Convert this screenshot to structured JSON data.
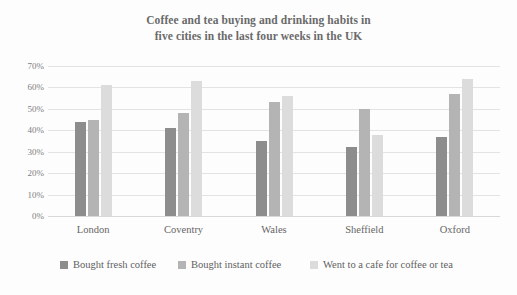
{
  "chart_data": {
    "type": "bar",
    "title": "Coffee and tea buying and drinking habits in five cities in the last four weeks in the UK",
    "title_lines": [
      "Coffee and tea buying and drinking habits in",
      "five cities in the last four weeks in the UK"
    ],
    "xlabel": "",
    "ylabel": "",
    "ylim": [
      0,
      70
    ],
    "ytick_step": 10,
    "yticks": [
      "0%",
      "10%",
      "20%",
      "30%",
      "40%",
      "50%",
      "60%",
      "70%"
    ],
    "ytick_values": [
      0,
      10,
      20,
      30,
      40,
      50,
      60,
      70
    ],
    "grid": true,
    "legend_position": "bottom",
    "categories": [
      "London",
      "Coventry",
      "Wales",
      "Sheffield",
      "Oxford"
    ],
    "series": [
      {
        "name": "Bought fresh coffee",
        "color": "#8d8d8d",
        "values": [
          44,
          41,
          35,
          32,
          37
        ]
      },
      {
        "name": "Bought instant coffee",
        "color": "#b4b4b4",
        "values": [
          45,
          48,
          53,
          50,
          57
        ]
      },
      {
        "name": "Went to a cafe for coffee or tea",
        "color": "#dcdcdc",
        "values": [
          61,
          63,
          56,
          38,
          64
        ]
      }
    ]
  },
  "colors": {
    "background": "#fdfdfd",
    "title_text": "#6a6a6a",
    "axis_text": "#7d7d7d",
    "gridline": "#e3e3e3"
  }
}
